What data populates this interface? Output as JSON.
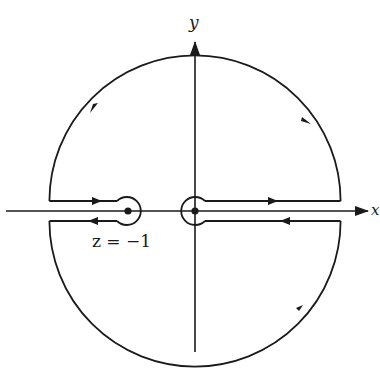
{
  "figure": {
    "type": "contour-integration-diagram",
    "axes": {
      "x_label": "x",
      "y_label": "y"
    },
    "annotations": {
      "pole_label": "z = −1"
    },
    "colors": {
      "stroke": "#1a1a1a",
      "background": "#ffffff"
    },
    "geometry": {
      "origin": [
        195,
        211
      ],
      "outer_radius": 142,
      "small_circle_radius": 14,
      "pole_point": [
        128,
        211
      ],
      "slit_half_gap": 10
    }
  }
}
